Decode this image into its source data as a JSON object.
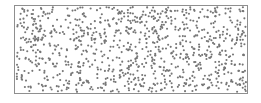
{
  "figure": {
    "type": "scatter-point-pattern",
    "title": "",
    "background_color": "#ffffff"
  },
  "frame": {
    "x": 14,
    "y": 5,
    "width": 234,
    "height": 89,
    "border_color": "#8f8f8f",
    "border_width": 1,
    "fill_color": "#ffffff"
  },
  "points": {
    "count": 950,
    "marker_color": "#767676",
    "marker_radius": 1.05,
    "marker_shape": "circle",
    "distribution": "uniform-random",
    "seed": 20240517
  },
  "chart_data": {
    "type": "scatter",
    "title": "",
    "xlabel": "",
    "ylabel": "",
    "grid": false,
    "legend": false,
    "xlim": [
      0,
      234
    ],
    "ylim": [
      0,
      89
    ],
    "series": [
      {
        "name": "points",
        "marker": "circle",
        "color": "#767676",
        "n": 950,
        "description": "Uniformly distributed random points (complete spatial randomness) filling the rectangular plot window"
      }
    ]
  }
}
